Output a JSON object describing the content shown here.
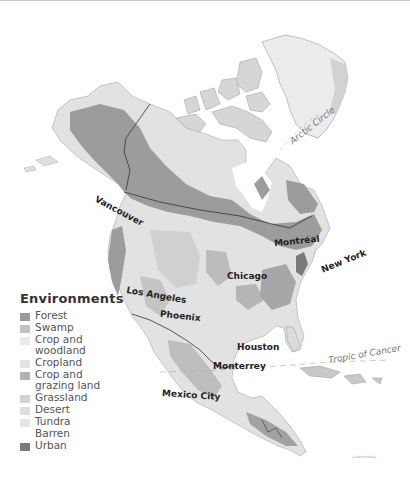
{
  "legend": {
    "title": "Environments",
    "items": [
      {
        "label": "Forest",
        "color": "#9a9a9a"
      },
      {
        "label": "Swamp",
        "color": "#c2c2c2"
      },
      {
        "label": "Crop and\nwoodland",
        "color": "#ebebeb"
      },
      {
        "label": "Cropland",
        "color": "#e4e4e4"
      },
      {
        "label": "Crop and\ngrazing land",
        "color": "#b3b3b3"
      },
      {
        "label": "Grassland",
        "color": "#d3d3d3"
      },
      {
        "label": "Desert",
        "color": "#dedede"
      },
      {
        "label": "Tundra",
        "color": "#e6e6e6"
      },
      {
        "label": "Barren",
        "color": "#ffffff"
      },
      {
        "label": "Urban",
        "color": "#7a7a7a"
      }
    ]
  },
  "cities": {
    "vancouver": "Vancouver",
    "montreal": "Montréal",
    "new_york": "New York",
    "chicago": "Chicago",
    "los_angeles": "Los Angeles",
    "phoenix": "Phoenix",
    "houston": "Houston",
    "monterrey": "Monterrey",
    "mexico_city": "Mexico City"
  },
  "latitudes": {
    "arctic_circle": "Arctic Circle",
    "tropic_of_cancer": "Tropic of Cancer"
  },
  "copyright": "© Rand McNally"
}
